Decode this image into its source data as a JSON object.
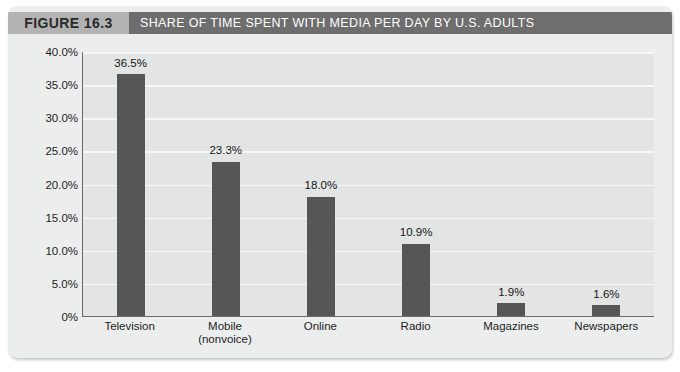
{
  "figure": {
    "badge_label": "FIGURE 16.3",
    "title": "SHARE OF TIME SPENT WITH MEDIA PER DAY BY U.S. ADULTS",
    "badge_color": "#b3b3b3",
    "title_bar_color": "#6e6e6e",
    "title_text_color": "#ffffff",
    "card_background": "#eceded"
  },
  "chart_data": {
    "type": "bar",
    "title": "SHARE OF TIME SPENT WITH MEDIA PER DAY BY U.S. ADULTS",
    "xlabel": "",
    "ylabel": "",
    "categories": [
      "Television",
      "Mobile (nonvoice)",
      "Online",
      "Radio",
      "Magazines",
      "Newspapers"
    ],
    "category_lines": [
      [
        "Television"
      ],
      [
        "Mobile",
        "(nonvoice)"
      ],
      [
        "Online"
      ],
      [
        "Radio"
      ],
      [
        "Magazines"
      ],
      [
        "Newspapers"
      ]
    ],
    "values": [
      36.5,
      23.3,
      18.0,
      10.9,
      1.9,
      1.6
    ],
    "value_labels": [
      "36.5%",
      "23.3%",
      "18.0%",
      "10.9%",
      "1.9%",
      "1.6%"
    ],
    "ylim": [
      0,
      40
    ],
    "ytick_values": [
      40.0,
      35.0,
      30.0,
      25.0,
      20.0,
      15.0,
      10.0,
      5.0,
      0
    ],
    "ytick_labels": [
      "40.0%",
      "35.0%",
      "30.0%",
      "25.0%",
      "20.0%",
      "15.0%",
      "10.0%",
      "5.0%",
      "0%"
    ],
    "grid": true,
    "legend": null,
    "bar_color": "#565656",
    "plot_background": "#e3e4e4",
    "gridline_color": "#f6f7f7",
    "axis_color": "#6a6a6a"
  }
}
